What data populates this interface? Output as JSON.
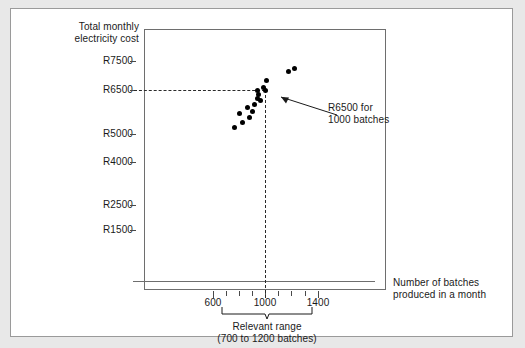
{
  "chart_data": {
    "type": "scatter",
    "title": "",
    "ylabel": "Total monthly electricity cost",
    "xlabel": "Number of batches produced in a month",
    "yticks": [
      {
        "label": "R7500",
        "value": 7500,
        "y": 61
      },
      {
        "label": "R6500",
        "value": 6500,
        "y": 90
      },
      {
        "label": "R5000",
        "value": 5000,
        "y": 134
      },
      {
        "label": "R4000",
        "value": 4000,
        "y": 162
      },
      {
        "label": "R2500",
        "value": 2500,
        "y": 205
      },
      {
        "label": "R1500",
        "value": 1500,
        "y": 230
      }
    ],
    "xticks_major": [
      {
        "label": "600",
        "value": 600,
        "x": 213
      },
      {
        "label": "1000",
        "value": 1000,
        "x": 265
      },
      {
        "label": "1400",
        "value": 1400,
        "x": 318
      }
    ],
    "xticks_minor_x": [
      213,
      226,
      239,
      252,
      265,
      278,
      291,
      305,
      318
    ],
    "points": [
      {
        "x": 234,
        "y": 127
      },
      {
        "x": 242,
        "y": 122
      },
      {
        "x": 239,
        "y": 113
      },
      {
        "x": 249,
        "y": 117
      },
      {
        "x": 247,
        "y": 107
      },
      {
        "x": 254,
        "y": 104
      },
      {
        "x": 257,
        "y": 98
      },
      {
        "x": 258,
        "y": 94
      },
      {
        "x": 257,
        "y": 90
      },
      {
        "x": 260,
        "y": 100
      },
      {
        "x": 263,
        "y": 87
      },
      {
        "x": 265,
        "y": 90
      },
      {
        "x": 266,
        "y": 80
      },
      {
        "x": 288,
        "y": 71
      },
      {
        "x": 294,
        "y": 68
      },
      {
        "x": 252,
        "y": 111
      }
    ],
    "guide_value_y": 6500,
    "guide_value_x": 1000,
    "grid": false,
    "legend": "none"
  },
  "axes": {
    "ytitle": "Total monthly\nelectricity cost",
    "ytitle_line1": "Total monthly",
    "ytitle_line2": "electricity cost",
    "xtitle_line1": "Number of batches",
    "xtitle_line2": "produced in a month"
  },
  "annotation": {
    "line1": "R6500 for",
    "line2": "1000 batches"
  },
  "relevant_range": {
    "line1": "Relevant range",
    "line2": "(700 to 1200 batches)"
  },
  "colors": {
    "point": "#000000",
    "axis": "#6e6e6e",
    "guide": "#2a2a2a",
    "text": "#1a1a1a",
    "page_bg": "#e8e8e8",
    "card_bg": "#ffffff"
  }
}
